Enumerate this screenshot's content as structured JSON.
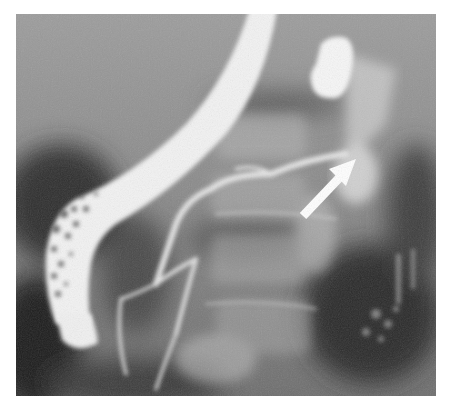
{
  "image": {
    "kind": "fluoroscopic radiograph (ERCP)",
    "background_color": "#ffffff",
    "frame": {
      "x": 16,
      "y": 14,
      "width": 420,
      "height": 382
    },
    "tones": {
      "field_light": "#9a9a9a",
      "field_mid": "#7a7a7a",
      "field_dark": "#2a2a2a",
      "contrast_white": "#f4f4f4"
    },
    "elements": [
      {
        "name": "endoscope",
        "description": "curved white endoscope tube from top center down to lower left"
      },
      {
        "name": "contrast-filled-gallbladder-or-duct",
        "description": "bright white blob at upper right"
      },
      {
        "name": "pancreatic-duct",
        "description": "thin branching opacified duct across center"
      },
      {
        "name": "annotation-arrow",
        "description": "white arrow pointing up-right at a duct narrowing"
      }
    ]
  }
}
